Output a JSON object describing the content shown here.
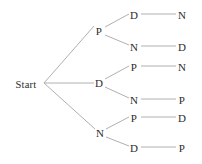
{
  "diagram": {
    "type": "probability-tree",
    "root": {
      "label": "Start",
      "x": 26,
      "y": 84
    },
    "level1": [
      {
        "label": "P",
        "x": 99,
        "y": 31
      },
      {
        "label": "D",
        "x": 99,
        "y": 83
      },
      {
        "label": "N",
        "x": 100,
        "y": 133
      }
    ],
    "level2": [
      {
        "label": "D",
        "x": 134,
        "y": 15
      },
      {
        "label": "N",
        "x": 134,
        "y": 47
      },
      {
        "label": "P",
        "x": 134,
        "y": 67
      },
      {
        "label": "N",
        "x": 134,
        "y": 100
      },
      {
        "label": "P",
        "x": 134,
        "y": 118
      },
      {
        "label": "D",
        "x": 134,
        "y": 148
      }
    ],
    "leaves": [
      {
        "label": "N",
        "x": 182,
        "y": 15
      },
      {
        "label": "D",
        "x": 182,
        "y": 47
      },
      {
        "label": "N",
        "x": 182,
        "y": 67
      },
      {
        "label": "P",
        "x": 182,
        "y": 100
      },
      {
        "label": "D",
        "x": 182,
        "y": 118
      },
      {
        "label": "P",
        "x": 182,
        "y": 148
      }
    ],
    "paths": [
      [
        "Start",
        "P",
        "D",
        "N"
      ],
      [
        "Start",
        "P",
        "N",
        "D"
      ],
      [
        "Start",
        "D",
        "P",
        "N"
      ],
      [
        "Start",
        "D",
        "N",
        "P"
      ],
      [
        "Start",
        "N",
        "P",
        "D"
      ],
      [
        "Start",
        "N",
        "D",
        "P"
      ]
    ],
    "edges": [
      {
        "from": "Start",
        "to": "P",
        "x1": 44,
        "y1": 83,
        "x2": 94,
        "y2": 26
      },
      {
        "from": "Start",
        "to": "D",
        "x1": 44,
        "y1": 83,
        "x2": 94,
        "y2": 83
      },
      {
        "from": "Start",
        "to": "N",
        "x1": 44,
        "y1": 83,
        "x2": 95,
        "y2": 129
      },
      {
        "from": "P",
        "to": "D",
        "x1": 105,
        "y1": 27,
        "x2": 129,
        "y2": 14
      },
      {
        "from": "P",
        "to": "N",
        "x1": 105,
        "y1": 35,
        "x2": 129,
        "y2": 45
      },
      {
        "from": "D",
        "to": "P",
        "x1": 105,
        "y1": 79,
        "x2": 129,
        "y2": 66
      },
      {
        "from": "D",
        "to": "N",
        "x1": 105,
        "y1": 87,
        "x2": 129,
        "y2": 98
      },
      {
        "from": "N",
        "to": "P",
        "x1": 106,
        "y1": 129,
        "x2": 129,
        "y2": 117
      },
      {
        "from": "N",
        "to": "D",
        "x1": 106,
        "y1": 137,
        "x2": 129,
        "y2": 146
      },
      {
        "from": "D2",
        "to": "N3",
        "x1": 141,
        "y1": 14,
        "x2": 176,
        "y2": 14
      },
      {
        "from": "N2",
        "to": "D3",
        "x1": 141,
        "y1": 46,
        "x2": 176,
        "y2": 46
      },
      {
        "from": "P2",
        "to": "N3",
        "x1": 141,
        "y1": 66,
        "x2": 176,
        "y2": 66
      },
      {
        "from": "N2b",
        "to": "P3",
        "x1": 141,
        "y1": 99,
        "x2": 176,
        "y2": 99
      },
      {
        "from": "P2b",
        "to": "D3",
        "x1": 141,
        "y1": 117,
        "x2": 176,
        "y2": 117
      },
      {
        "from": "D2b",
        "to": "P3",
        "x1": 141,
        "y1": 147,
        "x2": 176,
        "y2": 147
      }
    ],
    "colors": {
      "background": "#ffffff",
      "text": "#2b2b2b",
      "edge": "#b0b0b0"
    }
  }
}
